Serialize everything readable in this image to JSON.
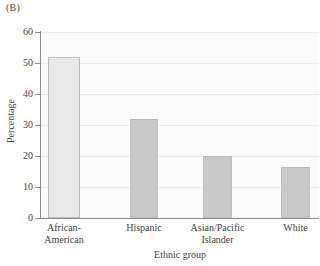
{
  "figure": {
    "panel_label": "(B)"
  },
  "chart_data": {
    "type": "bar",
    "title": "",
    "xlabel": "Ethnic group",
    "ylabel": "Percentage",
    "categories": [
      "African-\nAmerican",
      "Hispanic",
      "Asian/Pacific\nIslander",
      "White"
    ],
    "category_lines": [
      [
        "African-",
        "American"
      ],
      [
        "Hispanic"
      ],
      [
        "Asian/Pacific",
        "Islander"
      ],
      [
        "White"
      ]
    ],
    "values": [
      52,
      32,
      20,
      16.5
    ],
    "ylim": [
      0,
      60
    ],
    "ytick_labels": [
      "0",
      "10",
      "20",
      "30",
      "40",
      "50",
      "60"
    ],
    "ytick_values": [
      0,
      10,
      20,
      30,
      40,
      50,
      60
    ],
    "grid": true,
    "legend": "none",
    "bar_colors": [
      "#e8e8e8",
      "#c9c9c9",
      "#c9c9c9",
      "#c9c9c9"
    ],
    "bar_border_color": "#bdbdbd",
    "axis_color": "#8d8d8d",
    "gridline_color": "#ececec",
    "plot_background": "#fbfbfb"
  }
}
